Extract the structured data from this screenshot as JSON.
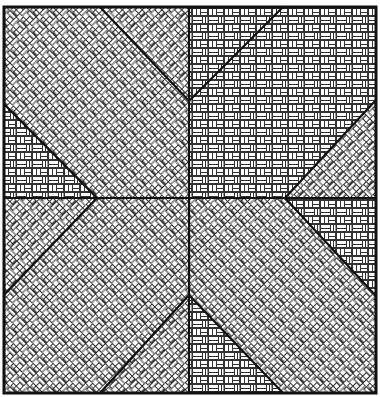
{
  "figure": {
    "title": "",
    "ink_color": "#111111",
    "paper_color": "#ffffff",
    "border": {
      "x1": 4,
      "y1": 7,
      "x2": 376,
      "y2": 393
    },
    "center": {
      "x": 189,
      "y": 198
    },
    "patterns": {
      "diagonal_weave": "diagonal basketweave",
      "straight_weave": "straight basketweave"
    },
    "regions": [
      {
        "name": "top-left-corner-triangle",
        "pattern": "straight",
        "points": [
          [
            4,
            104
          ],
          [
            97,
            198
          ],
          [
            4,
            198
          ]
        ]
      },
      {
        "name": "top-left-band",
        "pattern": "diag",
        "points": [
          [
            4,
            7
          ],
          [
            100,
            7
          ],
          [
            189,
            101
          ],
          [
            189,
            198
          ],
          [
            97,
            198
          ],
          [
            4,
            104
          ]
        ]
      },
      {
        "name": "top-center-left-triangle",
        "pattern": "diag2",
        "points": [
          [
            100,
            7
          ],
          [
            189,
            7
          ],
          [
            189,
            101
          ]
        ]
      },
      {
        "name": "top-center-right-triangle",
        "pattern": "diag2",
        "points": [
          [
            189,
            7
          ],
          [
            283,
            7
          ],
          [
            189,
            101
          ]
        ]
      },
      {
        "name": "top-right-band",
        "pattern": "straight",
        "points": [
          [
            283,
            7
          ],
          [
            376,
            7
          ],
          [
            376,
            100
          ],
          [
            285,
            198
          ],
          [
            189,
            198
          ],
          [
            189,
            101
          ]
        ]
      },
      {
        "name": "right-upper-triangle",
        "pattern": "diag2",
        "points": [
          [
            376,
            100
          ],
          [
            376,
            198
          ],
          [
            285,
            198
          ]
        ]
      },
      {
        "name": "right-lower-triangle",
        "pattern": "straight",
        "points": [
          [
            285,
            198
          ],
          [
            376,
            198
          ],
          [
            376,
            296
          ]
        ]
      },
      {
        "name": "bottom-right-band",
        "pattern": "diag",
        "points": [
          [
            189,
            198
          ],
          [
            285,
            198
          ],
          [
            376,
            296
          ],
          [
            376,
            393
          ],
          [
            283,
            393
          ],
          [
            189,
            295
          ]
        ]
      },
      {
        "name": "bottom-center-right-triangle",
        "pattern": "straight",
        "points": [
          [
            189,
            295
          ],
          [
            283,
            393
          ],
          [
            189,
            393
          ]
        ]
      },
      {
        "name": "bottom-center-left-triangle",
        "pattern": "diag2",
        "points": [
          [
            189,
            295
          ],
          [
            189,
            393
          ],
          [
            100,
            393
          ]
        ]
      },
      {
        "name": "bottom-left-band",
        "pattern": "diag",
        "points": [
          [
            4,
            198
          ],
          [
            97,
            198
          ],
          [
            189,
            198
          ],
          [
            189,
            295
          ],
          [
            100,
            393
          ],
          [
            4,
            393
          ],
          [
            4,
            295
          ]
        ]
      },
      {
        "name": "left-lower-triangle",
        "pattern": "diag2",
        "points": [
          [
            4,
            198
          ],
          [
            97,
            198
          ],
          [
            4,
            295
          ]
        ]
      }
    ]
  }
}
